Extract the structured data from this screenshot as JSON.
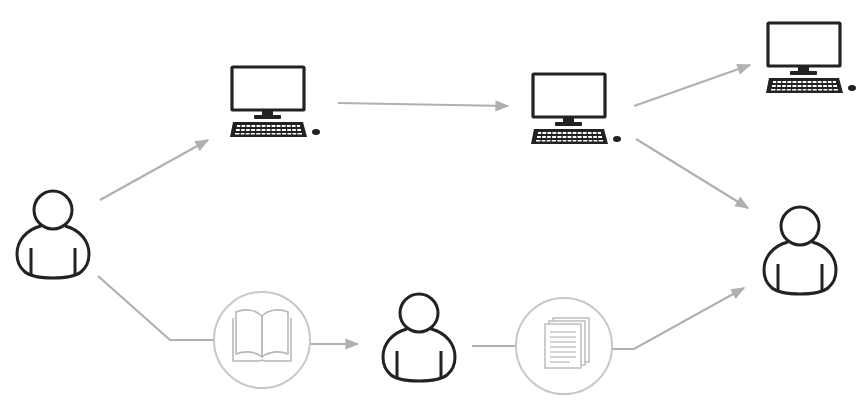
{
  "diagram": {
    "colors": {
      "background": "#ffffff",
      "icon_stroke": "#222222",
      "arrow": "#b0b0b0",
      "circle_stroke": "#c8c8c8",
      "circle_icon": "#b8b8b8"
    },
    "nodes": [
      {
        "id": "person-source",
        "icon": "person-icon"
      },
      {
        "id": "computer-1",
        "icon": "desktop-computer-icon"
      },
      {
        "id": "computer-2",
        "icon": "desktop-computer-icon"
      },
      {
        "id": "computer-3",
        "icon": "desktop-computer-icon"
      },
      {
        "id": "person-recipient",
        "icon": "person-icon"
      },
      {
        "id": "book",
        "icon": "open-book-icon"
      },
      {
        "id": "person-intermediary",
        "icon": "person-icon"
      },
      {
        "id": "documents",
        "icon": "document-stack-icon"
      }
    ],
    "edges": [
      {
        "from": "person-source",
        "to": "computer-1"
      },
      {
        "from": "computer-1",
        "to": "computer-2"
      },
      {
        "from": "computer-2",
        "to": "computer-3"
      },
      {
        "from": "computer-2",
        "to": "person-recipient"
      },
      {
        "from": "person-source",
        "to": "book"
      },
      {
        "from": "book",
        "to": "person-intermediary"
      },
      {
        "from": "person-intermediary",
        "to": "documents"
      },
      {
        "from": "documents",
        "to": "person-recipient"
      }
    ]
  }
}
